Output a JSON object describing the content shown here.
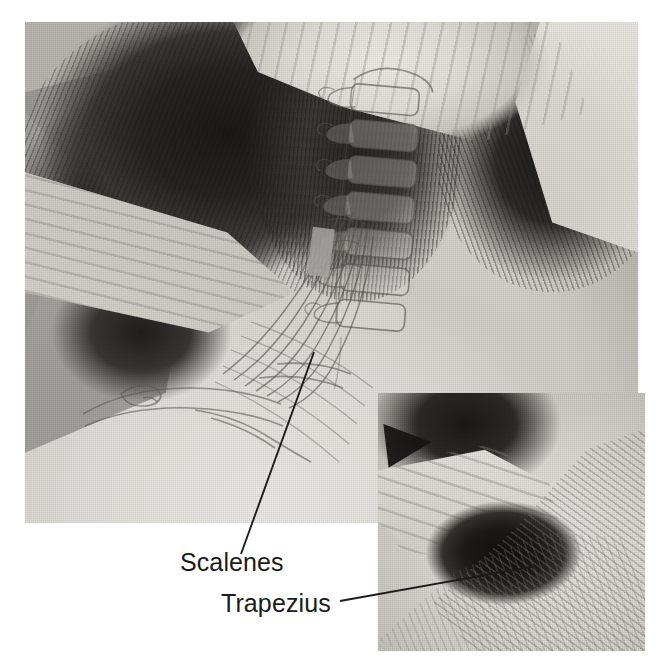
{
  "figure": {
    "kind": "anatomy-photograph-with-overlay",
    "background_color": "#ffffff",
    "ink_color": "#1b1b1b"
  },
  "main_photo": {
    "name": "main-photograph",
    "alt": "Therapist's hands cradling the back of a client's head and neck; cervical spine and scalene muscles drawn over the neck.",
    "frame": {
      "x": 25,
      "y": 22,
      "width": 613,
      "height": 501
    }
  },
  "inset_photo": {
    "name": "inset-photograph",
    "alt": "Close-up of fingers hooked under the upper trapezius with muscle fibers drawn over the shoulder.",
    "frame": {
      "x": 378,
      "y": 393,
      "width": 267,
      "height": 258
    }
  },
  "overlay": {
    "structures": [
      {
        "name": "cervical-vertebrae",
        "label": ""
      },
      {
        "name": "scalene-muscles",
        "label": ""
      },
      {
        "name": "clavicle-and-first-rib",
        "label": ""
      },
      {
        "name": "trapezius-fibers",
        "label": ""
      }
    ]
  },
  "labels": [
    {
      "id": "scalenes",
      "text": "Scalenes",
      "x": 180,
      "y": 548,
      "leader": {
        "x1": 314,
        "y1": 352,
        "x2": 241,
        "y2": 554
      }
    },
    {
      "id": "trapezius",
      "text": "Trapezius",
      "x": 221,
      "y": 589,
      "leader": {
        "x1": 340,
        "y1": 601,
        "x2": 536,
        "y2": 566
      }
    }
  ]
}
